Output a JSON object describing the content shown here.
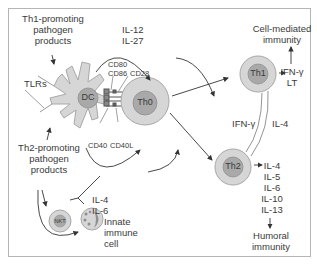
{
  "diagram": {
    "colors": {
      "cell_outer": "#d6d6d6",
      "cell_inner": "#a9a9a9",
      "cell_stroke": "#9a9a9a",
      "line": "#333333",
      "frame": "#b5b5b5"
    },
    "inputs": {
      "th1_promoting": [
        "Th1-promoting",
        "pathogen",
        "products"
      ],
      "th2_promoting": [
        "Th2-promoting",
        "pathogen",
        "products"
      ],
      "tlrs": "TLRs"
    },
    "cells": {
      "dc": "DC",
      "th0": "Th0",
      "th1": "Th1",
      "th2": "Th2",
      "nkt": "NKT",
      "innate": [
        "Innate",
        "immune",
        "cell"
      ]
    },
    "molecules": {
      "costim_dc": [
        "CD80",
        "CD86"
      ],
      "cd28": "CD28",
      "cd40": "CD40",
      "cd40l": "CD40L"
    },
    "cytokines": {
      "dc_to_th0": [
        "IL-12",
        "IL-27"
      ],
      "innate_to_th0": [
        "IL-4",
        "IL-6"
      ],
      "th1_out": [
        "IFN-γ",
        "LT"
      ],
      "th2_out": [
        "IL-4",
        "IL-5",
        "IL-6",
        "IL-10",
        "IL-13"
      ],
      "cross_th1": "IFN-γ",
      "cross_th2": "IL-4"
    },
    "outcomes": {
      "th1": [
        "Cell-mediated",
        "immunity"
      ],
      "th2": [
        "Humoral",
        "immunity"
      ]
    }
  }
}
